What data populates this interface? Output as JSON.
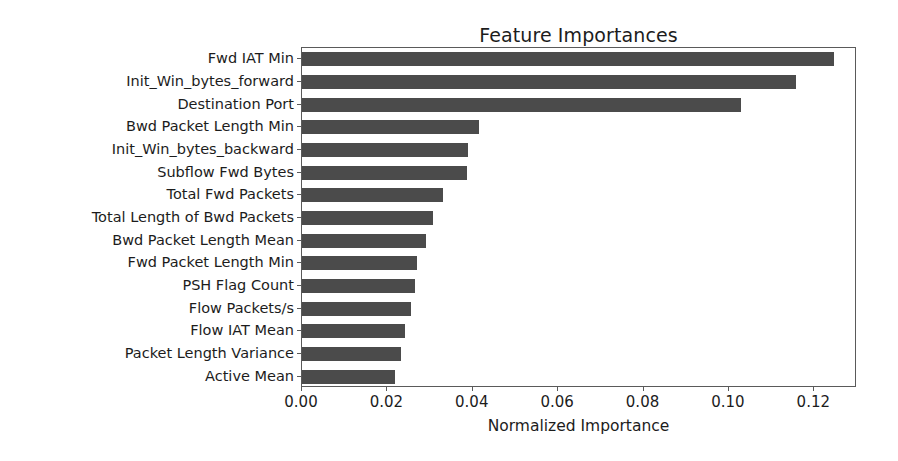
{
  "chart_data": {
    "type": "bar",
    "orientation": "horizontal",
    "title": "Feature Importances",
    "xlabel": "Normalized Importance",
    "ylabel": "",
    "xlim": [
      0.0,
      0.13
    ],
    "xticks": [
      "0.00",
      "0.02",
      "0.04",
      "0.06",
      "0.08",
      "0.10",
      "0.12"
    ],
    "xtick_values": [
      0.0,
      0.02,
      0.04,
      0.06,
      0.08,
      0.1,
      0.12
    ],
    "grid": false,
    "legend": null,
    "bar_color": "#4b4b4b",
    "categories": [
      "Fwd IAT Min",
      "Init_Win_bytes_forward",
      "Destination Port",
      "Bwd Packet Length Min",
      "Init_Win_bytes_backward",
      "Subflow Fwd Bytes",
      "Total Fwd Packets",
      "Total Length of Bwd Packets",
      "Bwd Packet Length Mean",
      "Fwd Packet Length Min",
      "PSH Flag Count",
      "Flow Packets/s",
      "Flow IAT Mean",
      "Packet Length Variance",
      "Active Mean"
    ],
    "values": [
      0.1247,
      0.1158,
      0.1029,
      0.0415,
      0.0389,
      0.0387,
      0.033,
      0.0307,
      0.0291,
      0.027,
      0.0264,
      0.0255,
      0.0241,
      0.0231,
      0.0218
    ]
  }
}
